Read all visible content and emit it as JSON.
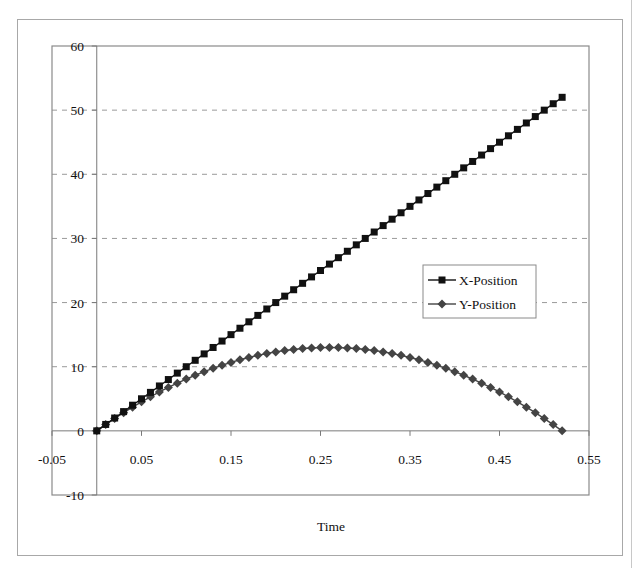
{
  "chart_data": {
    "type": "scatter",
    "title": "",
    "xlabel": "Time",
    "ylabel": "",
    "xlim": [
      -0.05,
      0.55
    ],
    "ylim": [
      -10,
      60
    ],
    "x_ticks": [
      "-0.05",
      "0.05",
      "0.15",
      "0.25",
      "0.35",
      "0.45",
      "0.55"
    ],
    "y_ticks": [
      "60",
      "50",
      "40",
      "30",
      "20",
      "10",
      "0",
      "-10"
    ],
    "grid": "horizontal dashed",
    "legend_position": "right-middle",
    "x": [
      0,
      0.01,
      0.02,
      0.03,
      0.04,
      0.05,
      0.06,
      0.07,
      0.08,
      0.09,
      0.1,
      0.11,
      0.12,
      0.13,
      0.14,
      0.15,
      0.16,
      0.17,
      0.18,
      0.19,
      0.2,
      0.21,
      0.22,
      0.23,
      0.24,
      0.25,
      0.26,
      0.27,
      0.28,
      0.29,
      0.3,
      0.31,
      0.32,
      0.33,
      0.34,
      0.35,
      0.36,
      0.37,
      0.38,
      0.39,
      0.4,
      0.41,
      0.42,
      0.43,
      0.44,
      0.45,
      0.46,
      0.47,
      0.48,
      0.49,
      0.5,
      0.51,
      0.52
    ],
    "series": [
      {
        "name": "X-Position",
        "marker": "square",
        "color": "#111111",
        "values": [
          0,
          1,
          2,
          3,
          4,
          5,
          6,
          7,
          8,
          9,
          10,
          11,
          12,
          13,
          14,
          15,
          16,
          17,
          18,
          19,
          20,
          21,
          22,
          23,
          24,
          25,
          26,
          27,
          28,
          29,
          30,
          31,
          32,
          33,
          34,
          35,
          36,
          37,
          38,
          39,
          40,
          41,
          42,
          43,
          44,
          45,
          46,
          47,
          48,
          49,
          50,
          51,
          52
        ]
      },
      {
        "name": "Y-Position",
        "marker": "diamond",
        "color": "#444444",
        "values": [
          0,
          0.98,
          1.92,
          2.83,
          3.69,
          4.52,
          5.31,
          6.06,
          6.77,
          7.44,
          8.08,
          8.67,
          9.23,
          9.75,
          10.23,
          10.67,
          11.08,
          11.44,
          11.77,
          12.06,
          12.31,
          12.52,
          12.69,
          12.83,
          12.92,
          12.98,
          13.0,
          12.98,
          12.92,
          12.83,
          12.69,
          12.52,
          12.31,
          12.06,
          11.77,
          11.44,
          11.08,
          10.67,
          10.23,
          9.75,
          9.23,
          8.67,
          8.08,
          7.44,
          6.77,
          6.06,
          5.31,
          4.52,
          3.69,
          2.83,
          1.92,
          0.98,
          0
        ]
      }
    ]
  }
}
